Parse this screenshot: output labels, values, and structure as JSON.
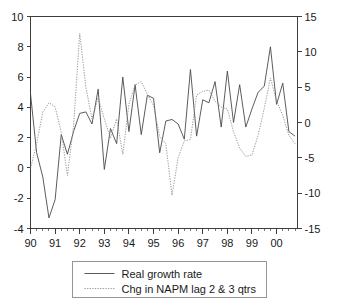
{
  "chart_data": {
    "type": "line",
    "title": "",
    "subtitle": "",
    "xlabel": "",
    "ylabel": "",
    "grid": false,
    "legend_position": "bottom-center",
    "x_axis": {
      "ticks": [
        "90",
        "91",
        "92",
        "93",
        "94",
        "95",
        "96",
        "97",
        "98",
        "99",
        "00"
      ],
      "tick_values": [
        1990,
        1991,
        1992,
        1993,
        1994,
        1995,
        1996,
        1997,
        1998,
        1999,
        2000
      ],
      "xlim": [
        1990,
        2000.85
      ],
      "minor_ticks_per_interval": 4
    },
    "y_axis_left": {
      "ticks": [
        "10",
        "8",
        "6",
        "4",
        "2",
        "0",
        "-2",
        "-4"
      ],
      "tick_values": [
        10,
        8,
        6,
        4,
        2,
        0,
        -2,
        -4
      ],
      "ylim": [
        -4,
        10
      ]
    },
    "y_axis_right": {
      "ticks": [
        "15",
        "10",
        "5",
        "0",
        "-5",
        "-10",
        "-15"
      ],
      "tick_values": [
        15,
        10,
        5,
        0,
        -5,
        -10,
        -15
      ],
      "ylim": [
        -15,
        15
      ]
    },
    "series": [
      {
        "name": "Real growth rate",
        "style": "solid",
        "color": "#4a4a4a",
        "axis": "left",
        "x": [
          1990.0,
          1990.25,
          1990.5,
          1990.75,
          1991.0,
          1991.25,
          1991.5,
          1991.75,
          1992.0,
          1992.25,
          1992.5,
          1992.75,
          1993.0,
          1993.25,
          1993.5,
          1993.75,
          1994.0,
          1994.25,
          1994.5,
          1994.75,
          1995.0,
          1995.25,
          1995.5,
          1995.75,
          1996.0,
          1996.25,
          1996.5,
          1996.75,
          1997.0,
          1997.25,
          1997.5,
          1997.75,
          1998.0,
          1998.25,
          1998.5,
          1998.75,
          1999.0,
          1999.25,
          1999.5,
          1999.75,
          2000.0,
          2000.25,
          2000.5,
          2000.75
        ],
        "y": [
          4.9,
          1.0,
          -0.6,
          -3.3,
          -2.1,
          2.2,
          0.9,
          2.4,
          3.6,
          3.7,
          2.9,
          5.2,
          -0.1,
          2.6,
          1.6,
          6.0,
          2.4,
          5.5,
          2.2,
          4.8,
          4.6,
          1.0,
          3.1,
          3.2,
          2.9,
          1.9,
          6.5,
          2.1,
          4.5,
          4.3,
          5.7,
          2.7,
          6.4,
          3.0,
          5.5,
          2.7,
          3.9,
          5.0,
          5.4,
          8.0,
          4.2,
          5.6,
          2.4,
          2.1
        ]
      },
      {
        "name": "Chg in NAPM lag 2 & 3 qtrs",
        "style": "dotted",
        "color": "#8f8f8f",
        "axis": "right",
        "x": [
          1990.0,
          1990.25,
          1990.5,
          1990.75,
          1991.0,
          1991.25,
          1991.5,
          1991.75,
          1992.0,
          1992.25,
          1992.5,
          1992.75,
          1993.0,
          1993.25,
          1993.5,
          1993.75,
          1994.0,
          1994.25,
          1994.5,
          1994.75,
          1995.0,
          1995.25,
          1995.5,
          1995.75,
          1996.0,
          1996.25,
          1996.5,
          1996.75,
          1997.0,
          1997.25,
          1997.5,
          1997.75,
          1998.0,
          1998.25,
          1998.5,
          1998.75,
          1999.0,
          1999.25,
          1999.5,
          1999.75,
          2000.0,
          2000.25,
          2000.5,
          2000.75
        ],
        "y": [
          -6.5,
          -3.0,
          1.5,
          2.8,
          2.2,
          -1.4,
          -7.5,
          -0.5,
          12.6,
          5.0,
          0.5,
          3.5,
          0.5,
          -2.2,
          0.5,
          -4.5,
          2.6,
          5.3,
          5.8,
          4.0,
          2.4,
          -2.0,
          -3.0,
          -10.3,
          -5.0,
          -2.6,
          -2.4,
          3.9,
          4.4,
          4.6,
          3.0,
          2.2,
          1.9,
          -1.3,
          -3.6,
          -4.8,
          -4.6,
          -1.8,
          2.0,
          6.3,
          3.0,
          1.0,
          -1.8,
          -3.0
        ]
      }
    ]
  },
  "legend": {
    "entries": [
      {
        "label": "Real growth rate",
        "style": "solid"
      },
      {
        "label": "Chg in NAPM lag 2 & 3 qtrs",
        "style": "dotted"
      }
    ]
  }
}
